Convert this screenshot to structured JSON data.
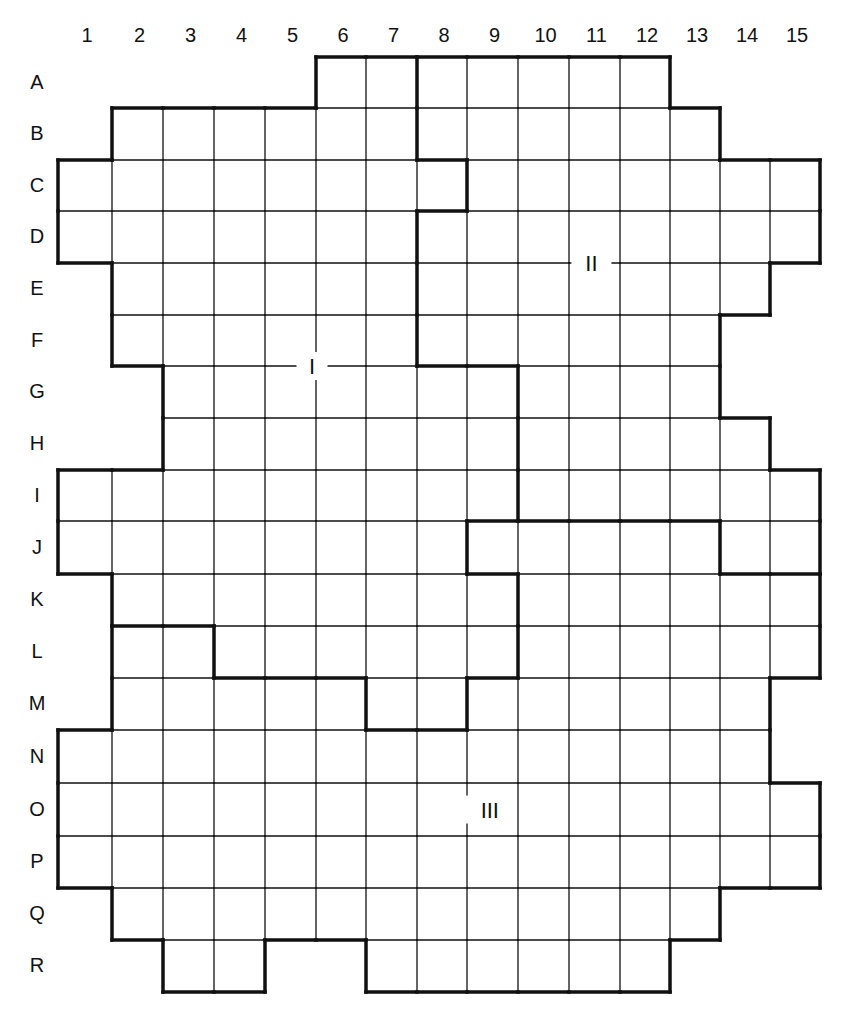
{
  "grid": {
    "column_labels": [
      "1",
      "2",
      "3",
      "4",
      "5",
      "6",
      "7",
      "8",
      "9",
      "10",
      "11",
      "12",
      "13",
      "14",
      "15"
    ],
    "row_labels": [
      "A",
      "B",
      "C",
      "D",
      "E",
      "F",
      "G",
      "H",
      "I",
      "J",
      "K",
      "L",
      "M",
      "N",
      "O",
      "P",
      "Q",
      "R"
    ],
    "row_spans": {
      "A": [
        [
          6,
          12
        ]
      ],
      "B": [
        [
          2,
          13
        ]
      ],
      "C": [
        [
          1,
          15
        ]
      ],
      "D": [
        [
          1,
          15
        ]
      ],
      "E": [
        [
          2,
          14
        ]
      ],
      "F": [
        [
          2,
          13
        ]
      ],
      "G": [
        [
          3,
          13
        ]
      ],
      "H": [
        [
          3,
          14
        ]
      ],
      "I": [
        [
          1,
          15
        ]
      ],
      "J": [
        [
          1,
          15
        ]
      ],
      "K": [
        [
          2,
          15
        ]
      ],
      "L": [
        [
          2,
          15
        ]
      ],
      "M": [
        [
          2,
          14
        ]
      ],
      "N": [
        [
          1,
          14
        ]
      ],
      "O": [
        [
          1,
          15
        ]
      ],
      "P": [
        [
          1,
          15
        ]
      ],
      "Q": [
        [
          2,
          13
        ]
      ],
      "R": [
        [
          3,
          4
        ],
        [
          7,
          12
        ]
      ]
    }
  },
  "regions": [
    {
      "label": "I",
      "label_row": "G",
      "label_col": 5.5
    },
    {
      "label": "II",
      "label_row": "E",
      "label_col": 11
    },
    {
      "label": "III",
      "label_row": "O",
      "label_col": 9
    }
  ],
  "region_map": {
    "A": {
      "II": [
        8,
        12
      ],
      "I": [
        6,
        7
      ]
    },
    "B": {
      "I": [
        2,
        7
      ],
      "II": [
        8,
        13
      ]
    },
    "C": {
      "I": [
        1,
        8
      ],
      "II": [
        9,
        15
      ]
    },
    "D": {
      "I": [
        1,
        7
      ],
      "II": [
        8,
        15
      ]
    },
    "E": {
      "I": [
        2,
        7
      ],
      "II": [
        8,
        14
      ]
    },
    "F": {
      "I": [
        2,
        7
      ],
      "II": [
        8,
        13
      ]
    },
    "G": {
      "I": [
        3,
        9
      ],
      "II": [
        10,
        13
      ]
    },
    "H": {
      "I": [
        3,
        9
      ],
      "II": [
        10,
        14
      ]
    },
    "I": {
      "I": [
        1,
        9
      ],
      "II": [
        10,
        15
      ]
    },
    "J": {
      "I": [
        1,
        8
      ],
      "III": [
        9,
        13
      ],
      "II": [
        14,
        15
      ]
    },
    "K": {
      "I": [
        2,
        9
      ],
      "III": [
        10,
        15
      ]
    },
    "L": {
      "III_left": [
        2,
        3
      ],
      "I": [
        4,
        9
      ],
      "III": [
        10,
        15
      ]
    },
    "M": {
      "III_left": [
        2,
        6
      ],
      "I": [
        7,
        8
      ],
      "III": [
        9,
        14
      ]
    },
    "N": {
      "III": [
        1,
        14
      ]
    },
    "O": {
      "III": [
        1,
        15
      ]
    },
    "P": {
      "III": [
        1,
        15
      ]
    },
    "Q": {
      "III": [
        2,
        13
      ]
    },
    "R": {
      "III": [
        3,
        4
      ],
      "III_right": [
        7,
        12
      ]
    }
  }
}
